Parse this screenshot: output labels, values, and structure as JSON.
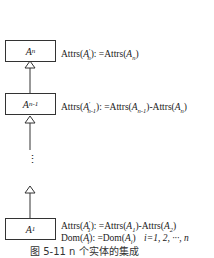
{
  "diagram": {
    "nodes": [
      {
        "id": "An",
        "base": "A",
        "sub": "n"
      },
      {
        "id": "An-1",
        "base": "A",
        "sub": "n-1"
      },
      {
        "id": "A1",
        "base": "A",
        "sub": "1"
      }
    ],
    "labels": {
      "an": {
        "pre": "Attrs(",
        "var": "A",
        "sub": "n",
        "sup": "′",
        "mid": "): =Attrs(",
        "var2": "A",
        "sub2": "n",
        "post": ")"
      },
      "an1": {
        "pre": "Attrs(",
        "var": "A",
        "sub": "n-1",
        "sup": "′",
        "mid": "): =Attrs(",
        "var2": "A",
        "sub2": "n-1",
        "mid2": ")-Attrs(",
        "var3": "A",
        "sub3": "n",
        "post": ")"
      },
      "a1_line1": {
        "pre": "Attrs(",
        "var": "A",
        "sub": "1",
        "sup": "′",
        "mid": "): =Attrs(",
        "var2": "A",
        "sub2": "1",
        "mid2": ")-Attrs(",
        "var3": "A",
        "sub3": "2",
        "post": ")"
      },
      "a1_line2": {
        "pre": "Dom(",
        "var": "A",
        "sub": "i",
        "sup": "′",
        "mid": "): =Dom(",
        "var2": "A",
        "sub2": "i",
        "post": ")",
        "range": "i=1, 2, ···, n"
      }
    },
    "ellipsis": "⋮",
    "caption": "图 5-11  n 个实体的集成"
  }
}
